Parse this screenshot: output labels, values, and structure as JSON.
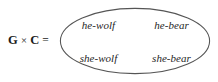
{
  "figure": {
    "type": "set-product-diagram",
    "equation": {
      "left_operand": "G",
      "operator": "×",
      "right_operand": "C",
      "equals": "="
    },
    "container": {
      "shape": "ellipse",
      "stroke_color": "#555555",
      "fill_color": "#ffffff"
    },
    "elements": [
      {
        "label": "he-wolf",
        "row": 0,
        "col": 0
      },
      {
        "label": "he-bear",
        "row": 0,
        "col": 1
      },
      {
        "label": "she-wolf",
        "row": 1,
        "col": 0
      },
      {
        "label": "she-bear",
        "row": 1,
        "col": 1
      }
    ]
  }
}
